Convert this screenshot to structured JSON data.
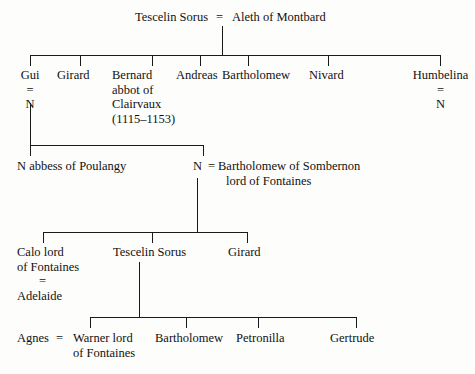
{
  "diagram": {
    "line_color": "#1a1a1a",
    "background": "#fdfdfb",
    "generations": [
      {
        "id": "gen-0",
        "label": "Founding couple",
        "people": [
          {
            "id": "tescelin-sorus-1",
            "name": "Tescelin Sorus"
          },
          {
            "id": "aleth-of-montbard",
            "name": "Aleth of Montbard"
          }
        ],
        "marriage_symbol": "="
      },
      {
        "id": "gen-1",
        "label": "Children of Tescelin Sorus and Aleth of Montbard",
        "people": [
          {
            "id": "gui",
            "name": "Gui",
            "spouse": "N",
            "marriage_symbol": "="
          },
          {
            "id": "girard-1",
            "name": "Girard"
          },
          {
            "id": "bernard",
            "name": "Bernard",
            "lines": [
              "Bernard",
              "abbot of",
              "Clairvaux",
              "(1115–1153)"
            ]
          },
          {
            "id": "andreas",
            "name": "Andreas"
          },
          {
            "id": "bartholomew-1",
            "name": "Bartholomew"
          },
          {
            "id": "nivard",
            "name": "Nivard"
          },
          {
            "id": "humbelina",
            "name": "Humbelina",
            "spouse": "N",
            "marriage_symbol": "="
          }
        ]
      },
      {
        "id": "gen-2",
        "label": "Children of Gui and N",
        "people": [
          {
            "id": "n-abbess",
            "name": "N abbess of Poulangy"
          },
          {
            "id": "n-sombernon",
            "name": "N",
            "marriage_symbol": "=",
            "spouse_lines": [
              "Bartholomew of Sombernon",
              "lord of Fontaines"
            ]
          }
        ]
      },
      {
        "id": "gen-3",
        "label": "Children of N and Bartholomew of Sombernon",
        "people": [
          {
            "id": "calo",
            "name": "Calo lord of Fontaines",
            "lines": [
              "Calo lord",
              "of Fontaines"
            ],
            "marriage_symbol": "=",
            "spouse": "Adelaide"
          },
          {
            "id": "tescelin-sorus-2",
            "name": "Tescelin Sorus"
          },
          {
            "id": "girard-2",
            "name": "Girard"
          }
        ]
      },
      {
        "id": "gen-4",
        "label": "Children of Tescelin Sorus",
        "people": [
          {
            "id": "warner",
            "name": "Warner lord of Fontaines",
            "lines": [
              "Warner lord",
              "of Fontaines"
            ],
            "spouse": "Agnes",
            "marriage_symbol": "="
          },
          {
            "id": "bartholomew-2",
            "name": "Bartholomew"
          },
          {
            "id": "petronilla",
            "name": "Petronilla"
          },
          {
            "id": "gertrude",
            "name": "Gertrude"
          }
        ]
      }
    ],
    "text": {
      "tescelin_sorus_top": "Tescelin Sorus",
      "eq_top": "=",
      "aleth": "Aleth of Montbard",
      "gui": "Gui",
      "gui_eq": "=",
      "gui_spouse": "N",
      "girard_1": "Girard",
      "bernard_l1": "Bernard",
      "bernard_l2": "abbot of",
      "bernard_l3": "Clairvaux",
      "bernard_l4": "(1115–1153)",
      "andreas": "Andreas",
      "bartholomew_1": "Bartholomew",
      "nivard": "Nivard",
      "humbelina": "Humbelina",
      "humbelina_eq": "=",
      "humbelina_spouse": "N",
      "n_abbess": "N abbess of Poulangy",
      "n_sombernon": "N",
      "n_sombernon_eq": "=",
      "sombernon_l1": "Bartholomew of Sombernon",
      "sombernon_l2": "lord of Fontaines",
      "calo_l1": "Calo lord",
      "calo_l2": "of Fontaines",
      "calo_eq": "=",
      "adelaide": "Adelaide",
      "tescelin_sorus_mid": "Tescelin Sorus",
      "girard_2": "Girard",
      "agnes": "Agnes",
      "agnes_eq": "=",
      "warner_l1": "Warner lord",
      "warner_l2": "of Fontaines",
      "bartholomew_2": "Bartholomew",
      "petronilla": "Petronilla",
      "gertrude": "Gertrude"
    }
  }
}
